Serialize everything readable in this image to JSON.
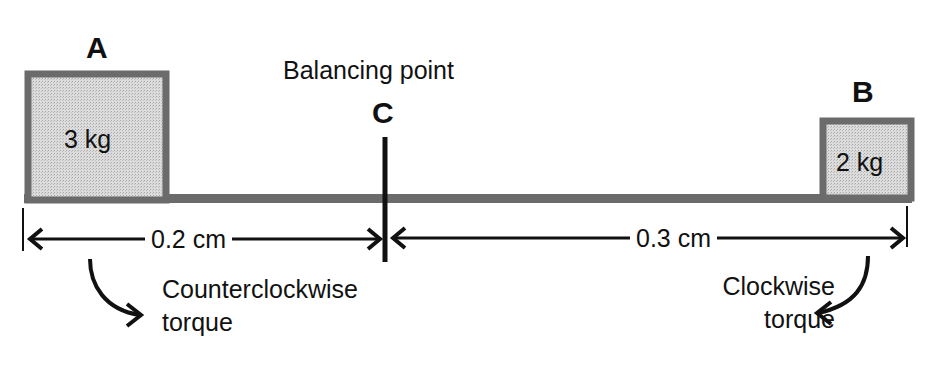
{
  "diagram": {
    "title_label": "Balancing point",
    "fulcrum": {
      "letter": "C"
    },
    "mass_a": {
      "letter": "A",
      "value": "3 kg"
    },
    "mass_b": {
      "letter": "B",
      "value": "2 kg"
    },
    "distances": {
      "left": "0.2 cm",
      "right": "0.3 cm"
    },
    "torques": {
      "left": {
        "line1": "Counterclockwise",
        "line2": "torque",
        "direction": "counterclockwise"
      },
      "right": {
        "line1": "Clockwise",
        "line2": "torque",
        "direction": "clockwise"
      }
    },
    "colors": {
      "beam": "#6b6b6b",
      "box_border": "#6b6b6b",
      "box_fill": "#d9d9d9",
      "ink": "#111111"
    }
  }
}
